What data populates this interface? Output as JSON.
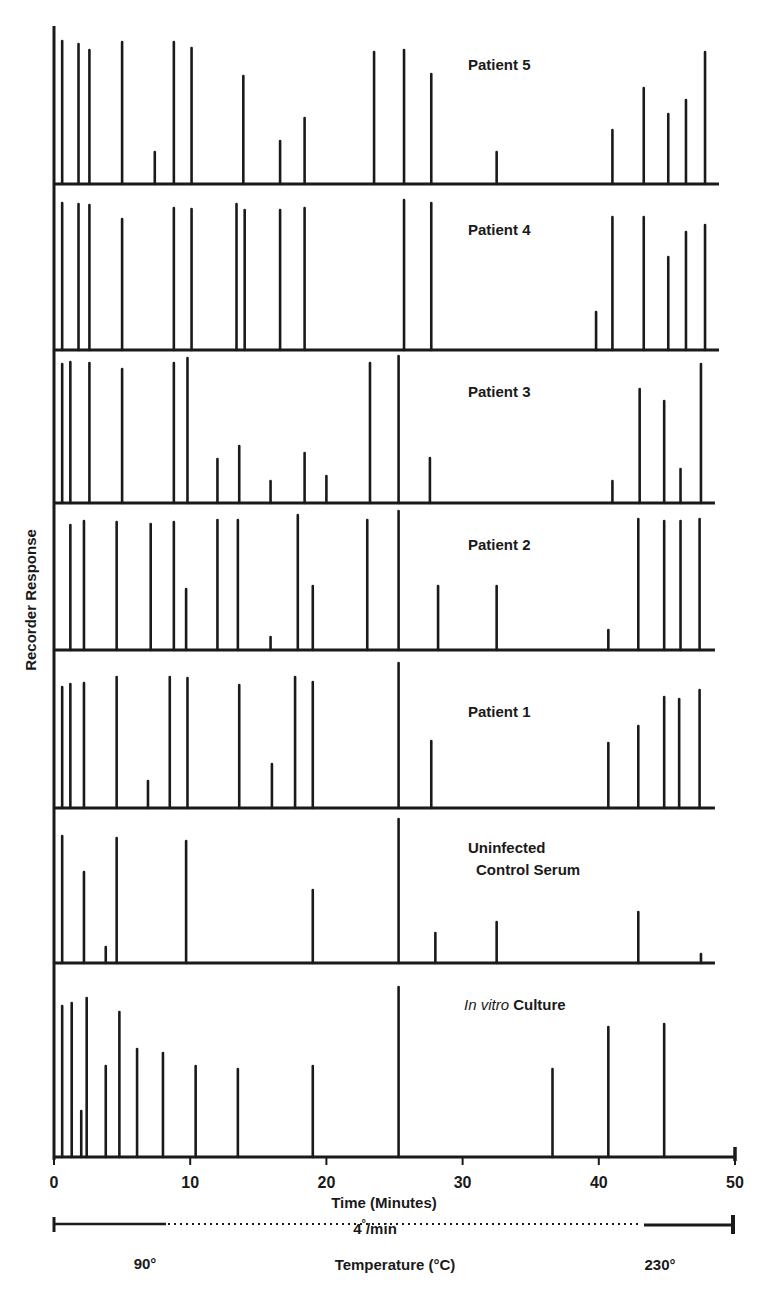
{
  "chart_data": {
    "type": "bar",
    "subtype": "stacked-chromatogram-panels",
    "title": "",
    "xlabel": "Time (Minutes)",
    "ylabel": "Recorder Response",
    "xlim": [
      0,
      50
    ],
    "x_ticks": [
      0,
      10,
      20,
      30,
      40,
      50
    ],
    "x_tick_labels": [
      "0",
      "10",
      "20",
      "30",
      "40",
      "50"
    ],
    "temperature_program": {
      "rate_label": "4°/min",
      "start_label": "90°",
      "end_label": "230°",
      "axis_label": "Temperature (°C)"
    },
    "grid": false,
    "legend": null,
    "value_units": "relative peak height (px, panel height ≈ 155)",
    "panels": [
      {
        "name": "Patient 5",
        "label_lines": [
          "Patient 5"
        ],
        "label_italic_prefix": "",
        "baseline_y": 184,
        "label_pos": [
          468,
          70
        ],
        "peaks": [
          [
            0.6,
            143
          ],
          [
            1.8,
            140
          ],
          [
            2.6,
            134
          ],
          [
            5.0,
            142
          ],
          [
            7.4,
            32
          ],
          [
            8.8,
            142
          ],
          [
            10.1,
            136
          ],
          [
            13.9,
            108
          ],
          [
            16.6,
            43
          ],
          [
            18.4,
            66
          ],
          [
            23.5,
            132
          ],
          [
            25.7,
            134
          ],
          [
            27.7,
            110
          ],
          [
            32.5,
            32
          ],
          [
            41.0,
            54
          ],
          [
            43.3,
            96
          ],
          [
            45.1,
            70
          ],
          [
            46.4,
            84
          ],
          [
            47.8,
            132
          ]
        ]
      },
      {
        "name": "Patient 4",
        "label_lines": [
          "Patient 4"
        ],
        "label_italic_prefix": "",
        "baseline_y": 350,
        "label_pos": [
          468,
          235
        ],
        "peaks": [
          [
            0.6,
            147
          ],
          [
            1.8,
            146
          ],
          [
            2.6,
            145
          ],
          [
            5.0,
            131
          ],
          [
            8.8,
            142
          ],
          [
            10.1,
            141
          ],
          [
            13.4,
            146
          ],
          [
            14.0,
            140
          ],
          [
            16.6,
            140
          ],
          [
            18.4,
            142
          ],
          [
            25.7,
            150
          ],
          [
            27.7,
            147
          ],
          [
            39.8,
            38
          ],
          [
            41.0,
            133
          ],
          [
            43.3,
            133
          ],
          [
            45.1,
            93
          ],
          [
            46.4,
            118
          ],
          [
            47.8,
            125
          ]
        ]
      },
      {
        "name": "Patient 3",
        "label_lines": [
          "Patient 3"
        ],
        "label_italic_prefix": "",
        "baseline_y": 503,
        "label_pos": [
          468,
          397
        ],
        "peaks": [
          [
            0.6,
            139
          ],
          [
            1.2,
            141
          ],
          [
            2.6,
            140
          ],
          [
            5.0,
            134
          ],
          [
            8.8,
            140
          ],
          [
            9.8,
            145
          ],
          [
            12.0,
            44
          ],
          [
            13.6,
            57
          ],
          [
            15.9,
            22
          ],
          [
            18.4,
            50
          ],
          [
            20.0,
            27
          ],
          [
            23.2,
            140
          ],
          [
            25.3,
            147
          ],
          [
            27.6,
            45
          ],
          [
            41.0,
            22
          ],
          [
            43.0,
            114
          ],
          [
            44.8,
            102
          ],
          [
            46.0,
            34
          ],
          [
            47.5,
            139
          ]
        ]
      },
      {
        "name": "Patient 2",
        "label_lines": [
          "Patient 2"
        ],
        "label_italic_prefix": "",
        "baseline_y": 650,
        "label_pos": [
          468,
          550
        ],
        "peaks": [
          [
            1.2,
            125
          ],
          [
            2.2,
            129
          ],
          [
            4.6,
            128
          ],
          [
            7.1,
            126
          ],
          [
            8.8,
            128
          ],
          [
            9.7,
            61
          ],
          [
            12.0,
            130
          ],
          [
            13.5,
            130
          ],
          [
            15.9,
            13
          ],
          [
            17.9,
            135
          ],
          [
            19.0,
            64
          ],
          [
            23.0,
            130
          ],
          [
            25.3,
            139
          ],
          [
            28.2,
            64
          ],
          [
            32.5,
            64
          ],
          [
            40.7,
            20
          ],
          [
            42.9,
            131
          ],
          [
            44.8,
            129
          ],
          [
            46.0,
            129
          ],
          [
            47.4,
            131
          ]
        ]
      },
      {
        "name": "Patient 1",
        "label_lines": [
          "Patient 1"
        ],
        "label_italic_prefix": "",
        "baseline_y": 808,
        "label_pos": [
          468,
          717
        ],
        "peaks": [
          [
            0.6,
            121
          ],
          [
            1.2,
            124
          ],
          [
            2.2,
            125
          ],
          [
            4.6,
            131
          ],
          [
            6.9,
            27
          ],
          [
            8.5,
            131
          ],
          [
            9.8,
            130
          ],
          [
            13.6,
            123
          ],
          [
            16.0,
            44
          ],
          [
            17.7,
            131
          ],
          [
            19.0,
            126
          ],
          [
            25.3,
            145
          ],
          [
            27.7,
            67
          ],
          [
            40.7,
            65
          ],
          [
            42.9,
            82
          ],
          [
            44.8,
            111
          ],
          [
            45.9,
            109
          ],
          [
            47.4,
            118
          ]
        ]
      },
      {
        "name": "Uninfected Control Serum",
        "label_lines": [
          "Uninfected",
          "Control Serum"
        ],
        "label_italic_prefix": "",
        "baseline_y": 963,
        "label_pos": [
          468,
          853
        ],
        "peaks": [
          [
            0.6,
            127
          ],
          [
            2.2,
            91
          ],
          [
            3.8,
            16
          ],
          [
            4.6,
            125
          ],
          [
            9.7,
            122
          ],
          [
            19.0,
            73
          ],
          [
            25.3,
            144
          ],
          [
            28.0,
            30
          ],
          [
            32.5,
            41
          ],
          [
            42.9,
            51
          ],
          [
            47.5,
            9
          ]
        ]
      },
      {
        "name": "In vitro Culture",
        "label_lines": [
          "Culture"
        ],
        "label_italic_prefix": "In vitro",
        "baseline_y": 1157,
        "label_pos": [
          464,
          1010
        ],
        "peaks": [
          [
            0.6,
            151
          ],
          [
            1.3,
            154
          ],
          [
            2.0,
            46
          ],
          [
            2.4,
            159
          ],
          [
            3.8,
            91
          ],
          [
            4.8,
            145
          ],
          [
            6.1,
            108
          ],
          [
            8.0,
            104
          ],
          [
            10.4,
            91
          ],
          [
            13.5,
            88
          ],
          [
            19.0,
            91
          ],
          [
            25.3,
            170
          ],
          [
            36.6,
            88
          ],
          [
            40.7,
            130
          ],
          [
            44.8,
            133
          ]
        ]
      }
    ]
  },
  "axis": {
    "y_title": "Recorder Response",
    "x_title": "Time (Minutes)",
    "ticks": [
      "0",
      "10",
      "20",
      "30",
      "40",
      "50"
    ],
    "rate_label": "4",
    "rate_deg": "°",
    "rate_unit": "/min",
    "temp_start": "90°",
    "temp_end": "230°",
    "temp_title": "Temperature (°C)"
  },
  "style": {
    "ink": "#1a1a1a",
    "background": "#ffffff"
  }
}
